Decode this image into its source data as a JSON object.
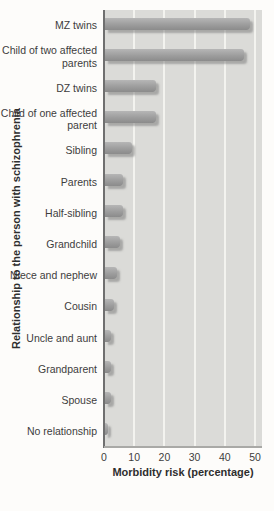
{
  "figure": {
    "x_axis_title": "Morbidity risk (percentage)",
    "y_axis_title": "Relationship to the person with schizophrenia"
  },
  "chart_data": {
    "type": "bar",
    "orientation": "horizontal",
    "title": "",
    "xlabel": "Morbidity risk (percentage)",
    "ylabel": "Relationship to the person with schizophrenia",
    "categories": [
      "MZ twins",
      "Child of two affected parents",
      "DZ twins",
      "Child of one affected parent",
      "Sibling",
      "Parents",
      "Half-sibling",
      "Grandchild",
      "Niece and nephew",
      "Cousin",
      "Uncle and aunt",
      "Grandparent",
      "Spouse",
      "No relationship"
    ],
    "values": [
      48,
      46,
      17,
      17,
      9,
      6,
      6,
      5,
      4,
      3,
      2,
      2,
      2,
      1
    ],
    "xlim": [
      0,
      50
    ],
    "xticks": [
      0,
      10,
      20,
      30,
      40,
      50
    ],
    "grid": "vertical-gridlines-on",
    "legend": "none",
    "colors": {
      "bar": "#9d9d9d",
      "bar_highlight": "#b6b6b6",
      "bar_shadow": "#7d7d7d",
      "plot_background": "#dbdbd8",
      "gridline": "#f3f3ef",
      "page_background": "#fdfcfa",
      "text": "#3d3d3d",
      "axis_line": "#6f6f6f"
    }
  }
}
